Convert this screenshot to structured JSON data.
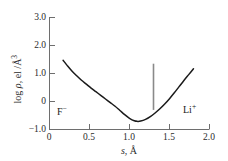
{
  "chart_data": {
    "type": "line",
    "title": "",
    "subtitle": "",
    "xlabel": "s, Å",
    "ylabel": "log ρ, el /Å³",
    "xlim": [
      0.0,
      2.0
    ],
    "ylim": [
      -1.0,
      3.0
    ],
    "grid": false,
    "legend": null,
    "xticks": [
      "0",
      "0.5",
      "1.0",
      "1.5",
      "2.0"
    ],
    "xtick_values": [
      0.0,
      0.5,
      1.0,
      1.5,
      2.0
    ],
    "yticks": [
      "3.0",
      "2.0",
      "1.0",
      "0",
      "-1.0"
    ],
    "ytick_values": [
      3.0,
      2.0,
      1.0,
      0.0,
      -1.0
    ],
    "series": [
      {
        "name": "log electron density along Li-F axis",
        "x": [
          0.17,
          0.22,
          0.28,
          0.34,
          0.4,
          0.46,
          0.52,
          0.58,
          0.64,
          0.7,
          0.76,
          0.82,
          0.88,
          0.94,
          1.0,
          1.06,
          1.1,
          1.14,
          1.2,
          1.26,
          1.32,
          1.38,
          1.44,
          1.5,
          1.56,
          1.62,
          1.68,
          1.74,
          1.8
        ],
        "y": [
          1.47,
          1.29,
          1.09,
          0.92,
          0.76,
          0.62,
          0.48,
          0.35,
          0.22,
          0.09,
          -0.04,
          -0.17,
          -0.32,
          -0.47,
          -0.6,
          -0.69,
          -0.71,
          -0.7,
          -0.64,
          -0.54,
          -0.41,
          -0.26,
          -0.09,
          0.1,
          0.31,
          0.53,
          0.75,
          0.96,
          1.17
        ]
      }
    ],
    "annotations": [
      {
        "name": "anion-label",
        "text": "F⁻",
        "text_base": "F",
        "text_sup": "−",
        "x": 0.27,
        "y": -0.63
      },
      {
        "name": "cation-label",
        "text": "Li⁺",
        "text_base": "Li",
        "text_sup": "+",
        "x": 1.73,
        "y": -0.55
      },
      {
        "name": "boundary-marker",
        "type": "vertical-line",
        "x": 1.3,
        "y_start": -0.3,
        "y_end": 1.35,
        "color": "#8a8a8a"
      }
    ],
    "curve_minimum": {
      "x": 1.1,
      "y": -0.71
    },
    "colors": {
      "curve": "#1a1a1a",
      "axis": "#6e6e6e",
      "marker": "#8a8a8a",
      "text": "#2b2b2b",
      "background": "#ffffff"
    }
  },
  "axes": {
    "y_title_prefix": "log ",
    "y_title_symbol": "ρ",
    "y_title_suffix": ", el /Å",
    "y_title_exponent": "3",
    "x_title_symbol": "s",
    "x_title_suffix": ", Å"
  },
  "ytick_labels": {
    "t0": "3.0",
    "t1": "2.0",
    "t2": "1.0",
    "t3": "0",
    "t4": "−1.0"
  },
  "xtick_labels": {
    "t0": "0",
    "t1": "0.5",
    "t2": "1.0",
    "t3": "1.5",
    "t4": "2.0"
  },
  "ion_labels": {
    "anion_base": "F",
    "anion_sup": "−",
    "cation_base": "Li",
    "cation_sup": "+"
  }
}
